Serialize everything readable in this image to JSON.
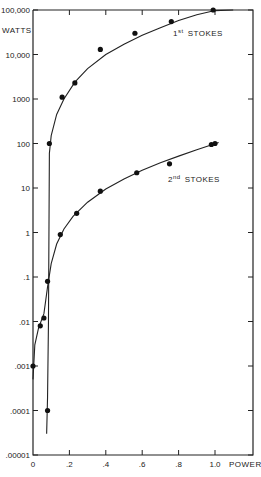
{
  "chart_data": {
    "type": "scatter",
    "title": "",
    "xlabel": "POWER",
    "ylabel": "WATTS",
    "xscale": "linear",
    "yscale": "log",
    "xlim": [
      0,
      1.2
    ],
    "ylim": [
      1e-05,
      100000
    ],
    "x_ticks": [
      0,
      0.2,
      0.4,
      0.6,
      0.8,
      1.0
    ],
    "x_tick_labels": [
      "0",
      ".2",
      ".4",
      ".6",
      ".8",
      "1.0"
    ],
    "y_ticks": [
      100000,
      10000,
      1000,
      100,
      10,
      1,
      0.1,
      0.01,
      0.001,
      0.0001,
      1e-05
    ],
    "y_tick_labels": [
      "100,000",
      "10,000",
      "1000",
      "100",
      "10",
      "1",
      ".1",
      ".01",
      ".001",
      ".0001",
      ".00001"
    ],
    "grid": false,
    "legend": "inline labels",
    "series": [
      {
        "name": "1st STOKES",
        "label_main": "1",
        "label_sup": "st",
        "label_rest": "STOKES",
        "points": [
          {
            "x": 0.08,
            "y": 0.0001
          },
          {
            "x": 0.09,
            "y": 100
          },
          {
            "x": 0.16,
            "y": 1100
          },
          {
            "x": 0.23,
            "y": 2300
          },
          {
            "x": 0.37,
            "y": 13000
          },
          {
            "x": 0.56,
            "y": 30000
          },
          {
            "x": 0.76,
            "y": 55000
          },
          {
            "x": 0.99,
            "y": 100000
          }
        ],
        "fit_curve": [
          {
            "x": 0.075,
            "y": 3e-05
          },
          {
            "x": 0.08,
            "y": 0.0002
          },
          {
            "x": 0.085,
            "y": 0.01
          },
          {
            "x": 0.09,
            "y": 60
          },
          {
            "x": 0.1,
            "y": 150
          },
          {
            "x": 0.13,
            "y": 450
          },
          {
            "x": 0.17,
            "y": 1000
          },
          {
            "x": 0.23,
            "y": 2400
          },
          {
            "x": 0.3,
            "y": 4800
          },
          {
            "x": 0.4,
            "y": 10000
          },
          {
            "x": 0.5,
            "y": 17000
          },
          {
            "x": 0.6,
            "y": 27000
          },
          {
            "x": 0.7,
            "y": 40000
          },
          {
            "x": 0.8,
            "y": 58000
          },
          {
            "x": 0.9,
            "y": 78000
          },
          {
            "x": 1.0,
            "y": 97000
          },
          {
            "x": 1.1,
            "y": 100000
          }
        ]
      },
      {
        "name": "2nd STOKES",
        "label_main": "2",
        "label_sup": "nd",
        "label_rest": "STOKES",
        "points": [
          {
            "x": 0.0,
            "y": 0.001
          },
          {
            "x": 0.04,
            "y": 0.008
          },
          {
            "x": 0.06,
            "y": 0.012
          },
          {
            "x": 0.08,
            "y": 0.08
          },
          {
            "x": 0.15,
            "y": 0.9
          },
          {
            "x": 0.24,
            "y": 2.7
          },
          {
            "x": 0.37,
            "y": 8.5
          },
          {
            "x": 0.57,
            "y": 22
          },
          {
            "x": 0.75,
            "y": 35
          },
          {
            "x": 0.98,
            "y": 95
          },
          {
            "x": 1.0,
            "y": 100
          }
        ],
        "fit_curve": [
          {
            "x": 0.0,
            "y": 0.0005
          },
          {
            "x": 0.01,
            "y": 0.003
          },
          {
            "x": 0.03,
            "y": 0.007
          },
          {
            "x": 0.06,
            "y": 0.015
          },
          {
            "x": 0.08,
            "y": 0.06
          },
          {
            "x": 0.1,
            "y": 0.2
          },
          {
            "x": 0.13,
            "y": 0.55
          },
          {
            "x": 0.17,
            "y": 1.2
          },
          {
            "x": 0.22,
            "y": 2.3
          },
          {
            "x": 0.3,
            "y": 4.8
          },
          {
            "x": 0.4,
            "y": 9.5
          },
          {
            "x": 0.5,
            "y": 16
          },
          {
            "x": 0.6,
            "y": 25
          },
          {
            "x": 0.7,
            "y": 37
          },
          {
            "x": 0.8,
            "y": 52
          },
          {
            "x": 0.9,
            "y": 72
          },
          {
            "x": 1.02,
            "y": 105
          }
        ]
      }
    ]
  },
  "axes": {
    "y_title": "WATTS",
    "x_title": "POWER"
  }
}
